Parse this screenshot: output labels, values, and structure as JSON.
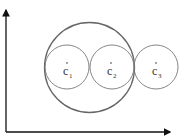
{
  "diagram": {
    "axes": {
      "x_label": "",
      "y_label": ""
    },
    "circles": [
      {
        "id": "c1",
        "label": "c",
        "subscript": "1",
        "role": "small"
      },
      {
        "id": "c2",
        "label": "c",
        "subscript": "2",
        "role": "small"
      },
      {
        "id": "c3",
        "label": "c",
        "subscript": "3",
        "role": "small"
      }
    ],
    "enclosing_circle": {
      "role": "large",
      "encloses": [
        "c1",
        "c2"
      ]
    },
    "colors": {
      "stroke": "#555555",
      "axis": "#111111"
    }
  }
}
